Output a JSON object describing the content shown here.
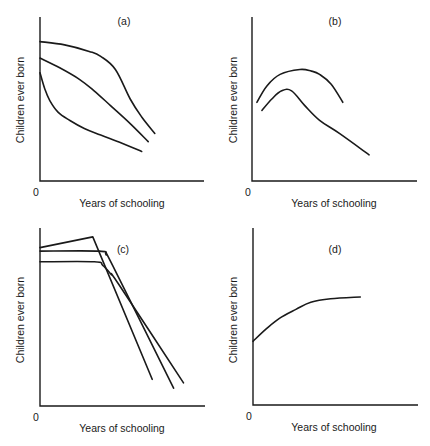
{
  "chart_data": [
    {
      "type": "line",
      "panel_label": "(a)",
      "xlabel": "Years of schooling",
      "ylabel": "Children ever born",
      "origin_label": "0",
      "xlim": [
        0,
        10
      ],
      "ylim": [
        0,
        10
      ],
      "grid": false,
      "series": [
        {
          "name": "curve-1",
          "points": [
            [
              0,
              8.5
            ],
            [
              1.5,
              8.3
            ],
            [
              3.0,
              7.9
            ],
            [
              3.7,
              7.6
            ],
            [
              4.6,
              6.8
            ],
            [
              5.5,
              5.0
            ],
            [
              6.2,
              3.9
            ],
            [
              7.0,
              2.9
            ]
          ]
        },
        {
          "name": "curve-2",
          "points": [
            [
              0,
              7.5
            ],
            [
              1.2,
              6.9
            ],
            [
              2.4,
              6.2
            ],
            [
              3.3,
              5.5
            ],
            [
              4.3,
              4.6
            ],
            [
              5.5,
              3.5
            ],
            [
              6.6,
              2.4
            ]
          ]
        },
        {
          "name": "curve-3",
          "points": [
            [
              0,
              6.6
            ],
            [
              0.3,
              5.6
            ],
            [
              0.6,
              4.9
            ],
            [
              1.1,
              4.2
            ],
            [
              1.8,
              3.7
            ],
            [
              2.7,
              3.2
            ],
            [
              3.7,
              2.8
            ],
            [
              5.0,
              2.3
            ],
            [
              6.2,
              1.8
            ]
          ]
        }
      ]
    },
    {
      "type": "line",
      "panel_label": "(b)",
      "xlabel": "Years of schooling",
      "ylabel": "Children ever born",
      "origin_label": "0",
      "xlim": [
        0,
        10
      ],
      "ylim": [
        0,
        10
      ],
      "grid": false,
      "series": [
        {
          "name": "curve-1",
          "points": [
            [
              0.3,
              4.8
            ],
            [
              0.9,
              5.8
            ],
            [
              1.7,
              6.5
            ],
            [
              2.9,
              6.8
            ],
            [
              3.6,
              6.7
            ],
            [
              4.1,
              6.5
            ],
            [
              4.8,
              5.9
            ],
            [
              5.5,
              4.8
            ]
          ]
        },
        {
          "name": "curve-2",
          "points": [
            [
              0.6,
              4.3
            ],
            [
              1.2,
              5.0
            ],
            [
              1.8,
              5.5
            ],
            [
              2.4,
              5.5
            ],
            [
              3.2,
              4.6
            ],
            [
              4.1,
              3.7
            ],
            [
              5.3,
              2.9
            ],
            [
              7.1,
              1.6
            ]
          ]
        }
      ]
    },
    {
      "type": "line",
      "panel_label": "(c)",
      "xlabel": "Years of schooling",
      "ylabel": "Children ever born",
      "origin_label": "0",
      "xlim": [
        0,
        10
      ],
      "ylim": [
        0,
        10
      ],
      "grid": false,
      "series": [
        {
          "name": "curve-1",
          "points": [
            [
              0,
              8.9
            ],
            [
              3.2,
              9.5
            ],
            [
              6.8,
              1.5
            ]
          ]
        },
        {
          "name": "curve-2",
          "points": [
            [
              0,
              8.7
            ],
            [
              3.6,
              8.7
            ],
            [
              4.0,
              8.5
            ],
            [
              4.4,
              7.9
            ],
            [
              8.1,
              1.0
            ]
          ]
        },
        {
          "name": "curve-3",
          "points": [
            [
              0,
              8.1
            ],
            [
              3.3,
              8.1
            ],
            [
              3.8,
              7.9
            ],
            [
              4.3,
              7.4
            ],
            [
              4.8,
              6.8
            ],
            [
              8.7,
              1.3
            ]
          ]
        }
      ]
    },
    {
      "type": "line",
      "panel_label": "(d)",
      "xlabel": "Years of schooling",
      "ylabel": "Children ever born",
      "origin_label": "0",
      "xlim": [
        0,
        10
      ],
      "ylim": [
        0,
        10
      ],
      "grid": false,
      "series": [
        {
          "name": "curve-1",
          "points": [
            [
              0,
              3.6
            ],
            [
              0.8,
              4.3
            ],
            [
              1.6,
              4.9
            ],
            [
              2.6,
              5.4
            ],
            [
              3.5,
              5.8
            ],
            [
              4.7,
              6.0
            ],
            [
              6.5,
              6.1
            ]
          ]
        }
      ]
    }
  ]
}
